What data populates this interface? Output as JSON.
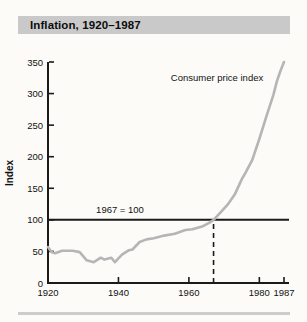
{
  "figure": {
    "title": "Inflation, 1920–1987"
  },
  "colors": {
    "page_bg": "#fcfbf8",
    "title_bar_bg": "#c9c9c9",
    "axis": "#1a1a1a",
    "line": "#b5b5b5",
    "bottom_rule": "#cccccc"
  },
  "chart_data": {
    "type": "line",
    "title": "Inflation, 1920–1987",
    "xlabel": "",
    "ylabel": "Index",
    "xlim": [
      1920,
      1987
    ],
    "ylim": [
      0,
      350
    ],
    "x_ticks": [
      1920,
      1940,
      1960,
      1980,
      1987
    ],
    "y_ticks": [
      0,
      50,
      100,
      150,
      200,
      250,
      300,
      350
    ],
    "grid": false,
    "legend_position": "none",
    "reference_line": {
      "y": 100,
      "label": "1967 = 100"
    },
    "dashed_marker": {
      "x": 1967,
      "from_y": 0,
      "to_y": 100
    },
    "series": [
      {
        "name": "Consumer price index",
        "x": [
          1920,
          1921,
          1922,
          1924,
          1927,
          1929,
          1931,
          1933,
          1935,
          1936,
          1938,
          1939,
          1941,
          1943,
          1944,
          1946,
          1948,
          1950,
          1953,
          1956,
          1959,
          1961,
          1964,
          1966,
          1967,
          1969,
          1971,
          1973,
          1975,
          1976,
          1978,
          1980,
          1982,
          1984,
          1985,
          1986,
          1987
        ],
        "y": [
          57,
          49,
          47,
          51,
          51,
          49,
          36,
          33,
          40,
          37,
          40,
          33,
          45,
          52,
          53,
          65,
          69,
          71,
          75,
          78,
          84,
          85,
          90,
          96,
          100,
          112,
          124,
          140,
          164,
          174,
          195,
          228,
          264,
          298,
          320,
          336,
          350
        ]
      }
    ],
    "annotations": [
      {
        "id": "series_label",
        "text": "Consumer price index"
      },
      {
        "id": "reference_label",
        "text": "1967 = 100"
      }
    ]
  }
}
